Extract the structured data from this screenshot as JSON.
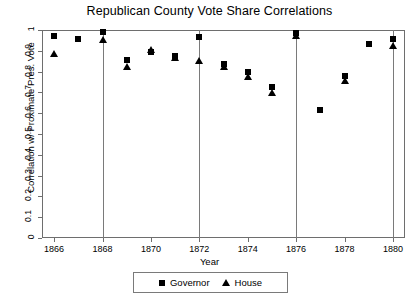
{
  "chart_data": {
    "type": "scatter",
    "title": "Republican County Vote Share Correlations",
    "xlabel": "Year",
    "ylabel": "Correlation w/ Proximate Pres. Vote",
    "xlim": [
      1865.5,
      1880.5
    ],
    "ylim": [
      0,
      1
    ],
    "xticks": [
      1866,
      1868,
      1870,
      1872,
      1874,
      1876,
      1878,
      1880
    ],
    "xticklabels": [
      "1866",
      "1868",
      "1870",
      "1872",
      "1874",
      "1876",
      "1878",
      "1880"
    ],
    "yticks": [
      0,
      0.1,
      0.2,
      0.3,
      0.4,
      0.5,
      0.6,
      0.7,
      0.8,
      0.9,
      1
    ],
    "yticklabels": [
      "0",
      "0.1",
      "0.2",
      "0.3",
      "0.4",
      "0.5",
      "0.6",
      "0.7",
      "0.8",
      "0.9",
      "1"
    ],
    "grid": false,
    "vertical_reference_lines": [
      1868,
      1872,
      1876,
      1880
    ],
    "legend_position": "bottom",
    "series": [
      {
        "name": "Governor",
        "marker": "square",
        "color": "#000000",
        "points": [
          {
            "x": 1866,
            "y": 0.97
          },
          {
            "x": 1867,
            "y": 0.955
          },
          {
            "x": 1868,
            "y": 0.99
          },
          {
            "x": 1869,
            "y": 0.855
          },
          {
            "x": 1870,
            "y": 0.895
          },
          {
            "x": 1871,
            "y": 0.875
          },
          {
            "x": 1872,
            "y": 0.965
          },
          {
            "x": 1873,
            "y": 0.835
          },
          {
            "x": 1874,
            "y": 0.8
          },
          {
            "x": 1875,
            "y": 0.725
          },
          {
            "x": 1876,
            "y": 0.985
          },
          {
            "x": 1877,
            "y": 0.615
          },
          {
            "x": 1878,
            "y": 0.78
          },
          {
            "x": 1879,
            "y": 0.935
          },
          {
            "x": 1880,
            "y": 0.955
          }
        ]
      },
      {
        "name": "House",
        "marker": "triangle",
        "color": "#000000",
        "points": [
          {
            "x": 1866,
            "y": 0.885
          },
          {
            "x": 1868,
            "y": 0.955
          },
          {
            "x": 1869,
            "y": 0.825
          },
          {
            "x": 1870,
            "y": 0.905
          },
          {
            "x": 1871,
            "y": 0.87
          },
          {
            "x": 1872,
            "y": 0.855
          },
          {
            "x": 1873,
            "y": 0.825
          },
          {
            "x": 1874,
            "y": 0.775
          },
          {
            "x": 1875,
            "y": 0.7
          },
          {
            "x": 1876,
            "y": 0.975
          },
          {
            "x": 1878,
            "y": 0.755
          },
          {
            "x": 1880,
            "y": 0.925
          }
        ]
      }
    ]
  },
  "legend": {
    "governor_label": "Governor",
    "house_label": "House"
  }
}
